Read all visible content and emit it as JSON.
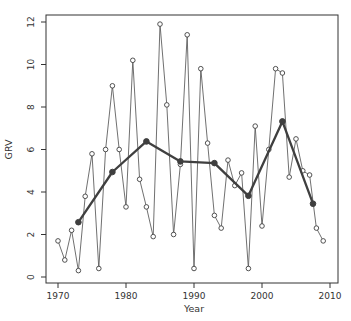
{
  "chart_data": {
    "type": "line",
    "title": "",
    "xlabel": "Year",
    "ylabel": "GRV",
    "xlim": [
      1968.5,
      2011.5
    ],
    "ylim": [
      0,
      12
    ],
    "xticks": [
      1970,
      1980,
      1990,
      2000,
      2010
    ],
    "yticks": [
      0,
      2,
      4,
      6,
      8,
      10,
      12
    ],
    "grid": "off",
    "legend": "none",
    "frame": "full-box",
    "series": [
      {
        "name": "annual-grv",
        "style": "thin-line-open-circles",
        "x": [
          1970,
          1971,
          1972,
          1973,
          1974,
          1975,
          1976,
          1977,
          1978,
          1979,
          1980,
          1981,
          1982,
          1983,
          1984,
          1985,
          1986,
          1987,
          1988,
          1989,
          1990,
          1991,
          1992,
          1993,
          1994,
          1995,
          1996,
          1997,
          1998,
          1999,
          2000,
          2001,
          2002,
          2003,
          2004,
          2005,
          2006,
          2007,
          2008,
          2009
        ],
        "values": [
          1.7,
          0.8,
          2.2,
          0.3,
          3.8,
          5.8,
          0.4,
          6.0,
          9.0,
          6.0,
          3.3,
          10.2,
          4.6,
          3.3,
          1.9,
          11.9,
          8.1,
          2.0,
          5.3,
          11.4,
          0.4,
          9.8,
          6.3,
          2.9,
          2.3,
          5.5,
          4.3,
          4.9,
          0.4,
          7.1,
          2.4,
          6.0,
          9.8,
          9.6,
          4.7,
          6.5,
          5.0,
          4.8,
          2.3,
          1.7
        ]
      },
      {
        "name": "five-year-mean-grv",
        "style": "thick-line-filled-circles",
        "x": [
          1973,
          1978,
          1983,
          1988,
          1993,
          1998,
          2003,
          2007.5
        ],
        "values": [
          2.58,
          4.94,
          6.38,
          5.44,
          5.36,
          3.82,
          7.32,
          3.45
        ]
      }
    ]
  },
  "colors": {
    "background": "#ffffff",
    "axis": "#333333",
    "text": "#333333",
    "thin_line": "#606060",
    "thin_marker_stroke": "#404040",
    "thin_marker_fill": "#ffffff",
    "thick_line": "#3f3f3f",
    "thick_marker_fill": "#3f3f3f"
  }
}
